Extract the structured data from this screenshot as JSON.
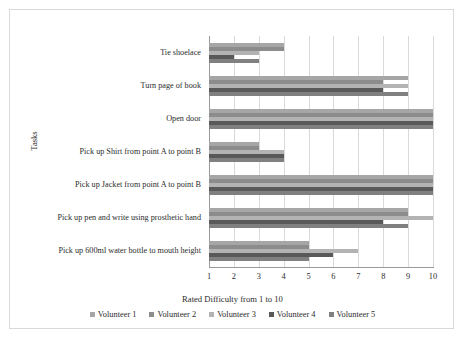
{
  "chart_data": {
    "type": "bar",
    "orientation": "horizontal",
    "title": "",
    "xlabel": "Rated Difficulty from 1 to 10",
    "ylabel": "Tasks",
    "xlim": [
      1,
      10
    ],
    "xticks": [
      "1",
      "2",
      "3",
      "4",
      "5",
      "6",
      "7",
      "8",
      "9",
      "10"
    ],
    "grid": true,
    "legend_position": "bottom",
    "categories": [
      "Tie shoelace",
      "Turn page of book",
      "Open door",
      "Pick up Shirt from point A to point B",
      "Pick up Jacket from point A to point B",
      "Pick up pen and write using prosthetic hand",
      "Pick up 600ml water bottle to mouth height"
    ],
    "series": [
      {
        "name": "Volunteer 1",
        "color": "#a6a6a6",
        "values": [
          4,
          9,
          10,
          3,
          10,
          9,
          5
        ]
      },
      {
        "name": "Volunteer 2",
        "color": "#8c8c8c",
        "values": [
          4,
          8,
          10,
          3,
          10,
          9,
          5
        ]
      },
      {
        "name": "Volunteer 3",
        "color": "#b3b3b3",
        "values": [
          3,
          9,
          10,
          4,
          10,
          10,
          7
        ]
      },
      {
        "name": "Volunteer 4",
        "color": "#595959",
        "values": [
          2,
          8,
          10,
          4,
          10,
          8,
          6
        ]
      },
      {
        "name": "Volunteer 5",
        "color": "#808080",
        "values": [
          3,
          9,
          10,
          4,
          10,
          9,
          5
        ]
      }
    ]
  },
  "colors": {
    "gridline": "#d9d9d9",
    "axis": "#9a9a9a",
    "text": "#2b2b2b",
    "frame": "#d9d9d9"
  }
}
